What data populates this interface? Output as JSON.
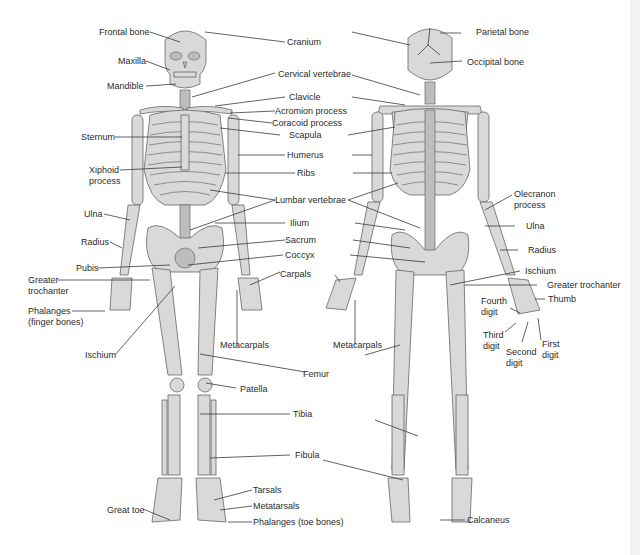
{
  "diagram": {
    "colors": {
      "bone": "#d9d9d9",
      "bone_shadow": "#bdbdbd",
      "outline": "#555555",
      "leader_line": "#3a3a3a",
      "text": "#2b2b2b",
      "background": "#ffffff"
    },
    "anterior_labels": {
      "frontal_bone": "Frontal bone",
      "maxilla": "Maxilla",
      "mandible": "Mandible",
      "sternum": "Sternum",
      "xiphoid_process": "Xiphoid\nprocess",
      "ulna": "Ulna",
      "radius": "Radius",
      "pubis": "Pubis",
      "greater_trochanter": "Greater\ntrochanter",
      "phalanges_finger": "Phalanges\n(finger bones)",
      "ischium": "Ischium",
      "metacarpals": "Metacarpals",
      "patella": "Patella",
      "great_toe": "Great toe",
      "tarsals": "Tarsals",
      "metatarsals": "Metatarsals",
      "phalanges_toe": "Phalanges (toe bones)"
    },
    "center_labels": {
      "cranium": "Cranium",
      "cervical_vertebrae": "Cervical vertebrae",
      "clavicle": "Clavicle",
      "acromion_process": "Acromion process",
      "coracoid_process": "Coracoid process",
      "scapula": "Scapula",
      "humerus": "Humerus",
      "ribs": "Ribs",
      "lumbar_vertebrae": "Lumbar vertebrae",
      "ilium": "Ilium",
      "sacrum": "Sacrum",
      "coccyx": "Coccyx",
      "carpals": "Carpals",
      "metacarpals_posterior": "Metacarpals",
      "femur": "Femur",
      "tibia": "Tibia",
      "fibula": "Fibula"
    },
    "posterior_labels": {
      "parietal_bone": "Parietal bone",
      "occipital_bone": "Occipital bone",
      "olecranon_process": "Olecranon\nprocess",
      "ulna": "Ulna",
      "radius": "Radius",
      "ischium": "Ischium",
      "greater_trochanter": "Greater trochanter",
      "thumb": "Thumb",
      "fourth_digit": "Fourth\ndigit",
      "third_digit": "Third\ndigit",
      "second_digit": "Second\ndigit",
      "first_digit": "First\ndigit",
      "calcaneus": "Calcaneus"
    }
  }
}
